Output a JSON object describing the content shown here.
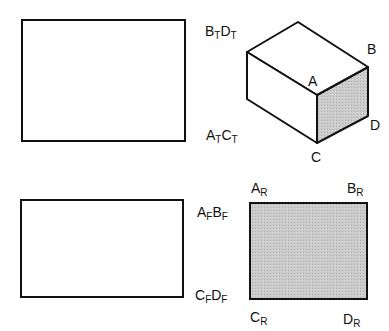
{
  "diagram": {
    "type": "orthographic-projection",
    "colors": {
      "stroke": "#111111",
      "shade": "#c8c8c8",
      "background": "#ffffff"
    },
    "top_view": {
      "label_top": {
        "a": "B",
        "as": "T",
        "b": "D",
        "bs": "T"
      },
      "label_bottom": {
        "a": "A",
        "as": "T",
        "b": "C",
        "bs": "T"
      }
    },
    "isometric": {
      "vertices": {
        "A": "A",
        "B": "B",
        "C": "C",
        "D": "D"
      }
    },
    "front_view": {
      "label_top": {
        "a": "A",
        "as": "F",
        "b": "B",
        "bs": "F"
      },
      "label_bottom": {
        "a": "C",
        "as": "F",
        "b": "D",
        "bs": "F"
      }
    },
    "right_view": {
      "corners": {
        "tl": {
          "a": "A",
          "s": "R"
        },
        "tr": {
          "a": "B",
          "s": "R"
        },
        "bl": {
          "a": "C",
          "s": "R"
        },
        "br": {
          "a": "D",
          "s": "R"
        }
      }
    }
  }
}
